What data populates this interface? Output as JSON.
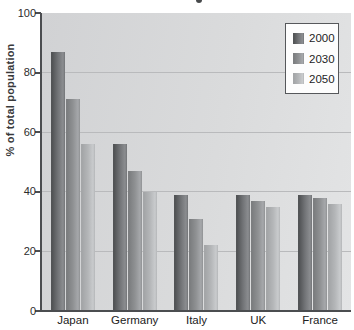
{
  "chart_data": {
    "type": "bar",
    "title": "",
    "ylabel": "% of total population",
    "categories": [
      "Japan",
      "Germany",
      "Italy",
      "UK",
      "France"
    ],
    "series": [
      {
        "name": "2000",
        "values": [
          87,
          56,
          39,
          39,
          39
        ],
        "gradient": [
          "#525456",
          "#727477",
          "#8b8d90"
        ]
      },
      {
        "name": "2030",
        "values": [
          71,
          47,
          31,
          37,
          38
        ],
        "gradient": [
          "#7c7e80",
          "#8f9193",
          "#a6a8ab"
        ]
      },
      {
        "name": "2050",
        "values": [
          56,
          40,
          22,
          35,
          36
        ],
        "gradient": [
          "#a4a6a8",
          "#b4b6b8",
          "#c9cbcd"
        ]
      }
    ],
    "ylim": [
      0,
      100
    ],
    "yticks": [
      0,
      20,
      40,
      60,
      80,
      100
    ],
    "grid": true,
    "legend_position": "top-right",
    "legend_labels": [
      "2000",
      "2030",
      "2050"
    ]
  }
}
